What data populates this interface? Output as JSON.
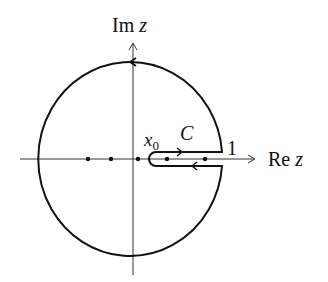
{
  "diagram": {
    "type": "contour-integral-keyhole",
    "labels": {
      "im_axis": "Im",
      "im_axis_var": "z",
      "re_axis": "Re",
      "re_axis_var": "z",
      "contour_name": "C",
      "point_name": "x",
      "point_subscript": "0",
      "unit_mark": "1"
    },
    "colors": {
      "stroke": "#111111",
      "axis": "#333333",
      "background": "#ffffff"
    },
    "contour": {
      "description": "Circle centered at origin passing near |z|=1, with a slit (keyhole) along the positive real axis from x0 to 1; arrows indicate counterclockwise orientation on the outer circle, rightward on the upper slit edge and leftward on the lower slit edge.",
      "orientation": "counterclockwise"
    },
    "points_on_real_axis": [
      {
        "label": "",
        "kind": "pole"
      },
      {
        "label": "",
        "kind": "pole"
      },
      {
        "label": "",
        "kind": "pole"
      },
      {
        "label": "",
        "kind": "pole-inside-slit"
      },
      {
        "label": "",
        "kind": "pole-inside-slit"
      }
    ]
  }
}
